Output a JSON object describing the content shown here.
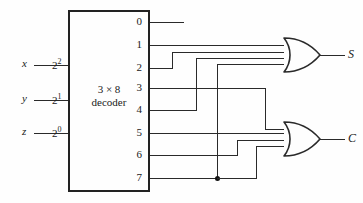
{
  "diagram": {
    "decoder": {
      "name": "decoder-block",
      "title_line1": "3 × 8",
      "title_line2": "decoder",
      "inputs": [
        {
          "signal": "x",
          "weight_base": "2",
          "weight_exp": "2"
        },
        {
          "signal": "y",
          "weight_base": "2",
          "weight_exp": "1"
        },
        {
          "signal": "z",
          "weight_base": "2",
          "weight_exp": "0"
        }
      ],
      "outputs": [
        "0",
        "1",
        "2",
        "3",
        "4",
        "5",
        "6",
        "7"
      ]
    },
    "gates": [
      {
        "name": "or-gate-sum",
        "type": "OR",
        "output_label": "S",
        "inputs_from": [
          "1",
          "2",
          "4",
          "7"
        ]
      },
      {
        "name": "or-gate-carry",
        "type": "OR",
        "output_label": "C",
        "inputs_from": [
          "3",
          "5",
          "6",
          "7"
        ]
      }
    ],
    "junction_label": "7",
    "colors": {
      "line": "#2a2a2a",
      "box_border": "#222222",
      "background": "#fefefe",
      "text": "#1a1a1a"
    }
  }
}
